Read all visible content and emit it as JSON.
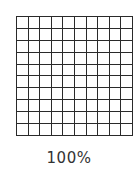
{
  "grid": {
    "rows": 10,
    "columns": 10,
    "shaded_cells": 0,
    "line_color": "#2a2a2a",
    "fill_color": "#ffffff"
  },
  "caption": "100%"
}
